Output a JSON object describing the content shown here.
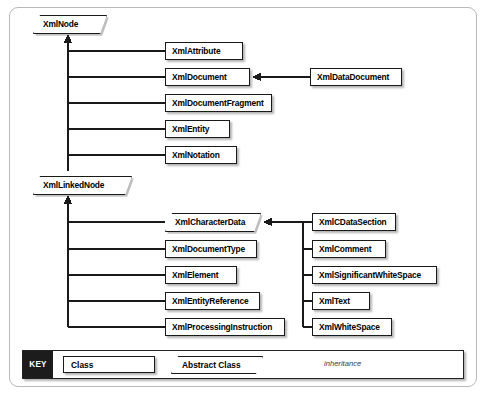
{
  "diagram": {
    "type": "uml-class-hierarchy",
    "title": "",
    "abstract_classes": [
      {
        "id": "XmlNode",
        "label": "XmlNode",
        "x": 33,
        "y": 15,
        "width": 74
      },
      {
        "id": "XmlLinkedNode",
        "label": "XmlLinkedNode",
        "x": 33,
        "y": 176,
        "width": 99
      },
      {
        "id": "XmlCharacterData",
        "label": "XmlCharacterData",
        "x": 165,
        "y": 213,
        "width": 96
      }
    ],
    "classes": [
      {
        "id": "XmlAttribute",
        "label": "XmlAttribute",
        "x": 165,
        "y": 42,
        "width": 78
      },
      {
        "id": "XmlDocument",
        "label": "XmlDocument",
        "x": 165,
        "y": 68,
        "width": 85
      },
      {
        "id": "XmlDocumentFragment",
        "label": "XmlDocumentFragment",
        "x": 165,
        "y": 94,
        "width": 107
      },
      {
        "id": "XmlEntity",
        "label": "XmlEntity",
        "x": 165,
        "y": 120,
        "width": 65
      },
      {
        "id": "XmlNotation",
        "label": "XmlNotation",
        "x": 165,
        "y": 146,
        "width": 72
      },
      {
        "id": "XmlDataDocument",
        "label": "XmlDataDocument",
        "x": 310,
        "y": 68,
        "width": 92
      },
      {
        "id": "XmlDocumentType",
        "label": "XmlDocumentType",
        "x": 165,
        "y": 240,
        "width": 92
      },
      {
        "id": "XmlElement",
        "label": "XmlElement",
        "x": 165,
        "y": 266,
        "width": 72
      },
      {
        "id": "XmlEntityReference",
        "label": "XmlEntityReference",
        "x": 165,
        "y": 292,
        "width": 95
      },
      {
        "id": "XmlProcessingInstruction",
        "label": "XmlProcessingInstruction",
        "x": 165,
        "y": 318,
        "width": 120
      },
      {
        "id": "XmlCDataSection",
        "label": "XmlCDataSection",
        "x": 312,
        "y": 213,
        "width": 84
      },
      {
        "id": "XmlComment",
        "label": "XmlComment",
        "x": 312,
        "y": 240,
        "width": 74
      },
      {
        "id": "XmlSignificantWhiteSpace",
        "label": "XmlSignificantWhiteSpace",
        "x": 312,
        "y": 266,
        "width": 125
      },
      {
        "id": "XmlText",
        "label": "XmlText",
        "x": 312,
        "y": 292,
        "width": 58
      },
      {
        "id": "XmlWhiteSpace",
        "label": "XmlWhiteSpace",
        "x": 312,
        "y": 318,
        "width": 80
      }
    ],
    "inheritance": [
      {
        "from": "XmlAttribute",
        "to": "XmlNode"
      },
      {
        "from": "XmlDocument",
        "to": "XmlNode"
      },
      {
        "from": "XmlDocumentFragment",
        "to": "XmlNode"
      },
      {
        "from": "XmlEntity",
        "to": "XmlNode"
      },
      {
        "from": "XmlNotation",
        "to": "XmlNode"
      },
      {
        "from": "XmlLinkedNode",
        "to": "XmlNode"
      },
      {
        "from": "XmlDataDocument",
        "to": "XmlDocument"
      },
      {
        "from": "XmlCharacterData",
        "to": "XmlLinkedNode"
      },
      {
        "from": "XmlDocumentType",
        "to": "XmlLinkedNode"
      },
      {
        "from": "XmlElement",
        "to": "XmlLinkedNode"
      },
      {
        "from": "XmlEntityReference",
        "to": "XmlLinkedNode"
      },
      {
        "from": "XmlProcessingInstruction",
        "to": "XmlLinkedNode"
      },
      {
        "from": "XmlCDataSection",
        "to": "XmlCharacterData"
      },
      {
        "from": "XmlComment",
        "to": "XmlCharacterData"
      },
      {
        "from": "XmlSignificantWhiteSpace",
        "to": "XmlCharacterData"
      },
      {
        "from": "XmlText",
        "to": "XmlCharacterData"
      },
      {
        "from": "XmlWhiteSpace",
        "to": "XmlCharacterData"
      }
    ]
  },
  "legend": {
    "key_label": "KEY",
    "class_label": "Class",
    "abstract_label": "Abstract Class",
    "inheritance_label": "inheritance"
  },
  "colors": {
    "line": "#1a1a1a",
    "box_border": "#1a1a1a",
    "box_fill": "#ffffff",
    "frame_border": "#b9b9b9",
    "key_badge_bg": "#1c1c1c",
    "key_badge_text": "#ffffff",
    "page_bg": "#ffffff"
  }
}
